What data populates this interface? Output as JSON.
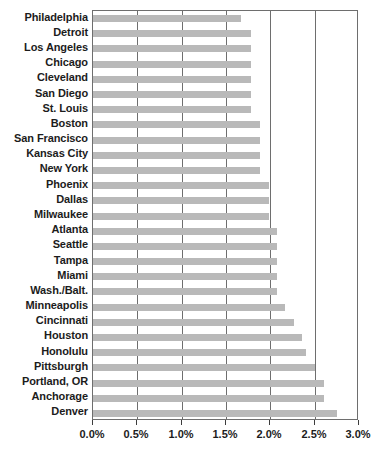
{
  "chart_data": {
    "type": "bar",
    "orientation": "horizontal",
    "title": "",
    "subtitle": "",
    "xlabel": "",
    "ylabel": "",
    "xlim": [
      0,
      3.0
    ],
    "grid": true,
    "legend": null,
    "value_unit": "%",
    "bar_color": "#b9b9b9",
    "axis_color": "#6e6e6e",
    "text_color": "#1c1c1c",
    "tick_labels": [
      "0.0%",
      "0.5%",
      "1.0%",
      "1.5%",
      "2.0%",
      "2.5%",
      "3.0%"
    ],
    "tick_values": [
      0.0,
      0.5,
      1.0,
      1.5,
      2.0,
      2.5,
      3.0
    ],
    "categories": [
      "Philadelphia",
      "Detroit",
      "Los Angeles",
      "Chicago",
      "Cleveland",
      "San Diego",
      "St. Louis",
      "Boston",
      "San Francisco",
      "Kansas City",
      "New York",
      "Phoenix",
      "Dallas",
      "Milwaukee",
      "Atlanta",
      "Seattle",
      "Tampa",
      "Miami",
      "Wash./Balt.",
      "Minneapolis",
      "Cincinnati",
      "Houston",
      "Honolulu",
      "Pittsburgh",
      "Portland, OR",
      "Anchorage",
      "Denver"
    ],
    "values": [
      1.67,
      1.78,
      1.78,
      1.78,
      1.78,
      1.78,
      1.78,
      1.88,
      1.88,
      1.88,
      1.88,
      1.98,
      1.98,
      1.98,
      2.07,
      2.07,
      2.07,
      2.07,
      2.07,
      2.17,
      2.27,
      2.36,
      2.4,
      2.5,
      2.6,
      2.6,
      2.75
    ]
  }
}
